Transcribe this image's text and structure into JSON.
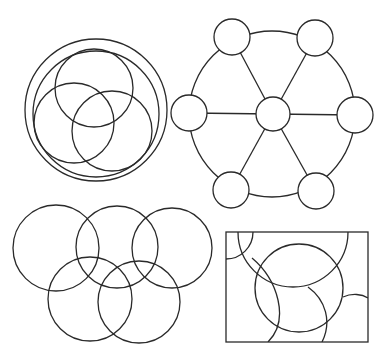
{
  "figures": [
    {
      "id": "nested-circles",
      "description": "Outer double ring containing three overlapping circles (Venn-like)",
      "outer_rings": [
        {
          "cx": 96,
          "cy": 110,
          "r": 71
        },
        {
          "cx": 96,
          "cy": 114,
          "r": 63
        }
      ],
      "inner_circles": [
        {
          "cx": 94,
          "cy": 88,
          "r": 39
        },
        {
          "cx": 74,
          "cy": 123,
          "r": 40
        },
        {
          "cx": 112,
          "cy": 131,
          "r": 40
        }
      ]
    },
    {
      "id": "hexagon-wheel",
      "description": "Ring of six node circles around a central node, spokes connect center to each node",
      "ring": {
        "cx": 272,
        "cy": 114,
        "r": 83
      },
      "center_node": {
        "cx": 273,
        "cy": 114,
        "r": 17
      },
      "outer_nodes": [
        {
          "cx": 232,
          "cy": 37,
          "r": 18
        },
        {
          "cx": 315,
          "cy": 38,
          "r": 18
        },
        {
          "cx": 189,
          "cy": 113,
          "r": 18
        },
        {
          "cx": 355,
          "cy": 115,
          "r": 18
        },
        {
          "cx": 231,
          "cy": 190,
          "r": 18
        },
        {
          "cx": 316,
          "cy": 191,
          "r": 18
        }
      ]
    },
    {
      "id": "interlocking-rings",
      "description": "Five overlapping circles in two rows (Olympic-rings style)",
      "circles": [
        {
          "cx": 56,
          "cy": 248,
          "r": 43
        },
        {
          "cx": 117,
          "cy": 247,
          "r": 41
        },
        {
          "cx": 172,
          "cy": 248,
          "r": 40
        },
        {
          "cx": 90,
          "cy": 299,
          "r": 42
        },
        {
          "cx": 139,
          "cy": 302,
          "r": 41
        }
      ]
    },
    {
      "id": "rectangle-arcs",
      "description": "Rectangle with a central circle and several intersecting arcs",
      "rect": {
        "x": 226,
        "y": 232,
        "w": 142,
        "h": 110
      },
      "circle": {
        "cx": 299,
        "cy": 288,
        "r": 44
      }
    }
  ]
}
